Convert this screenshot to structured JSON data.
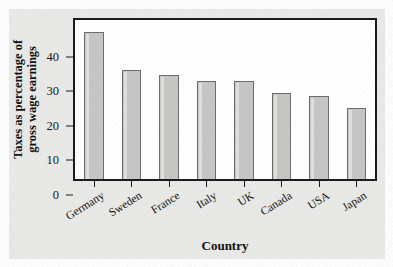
{
  "chart_data": {
    "type": "bar",
    "title": "",
    "xlabel": "Country",
    "ylabel": "Taxes as percentage of gross wage earnings",
    "ylabel_line1": "Taxes as percentage of",
    "ylabel_line2": "gross wage earnings",
    "categories": [
      "Germany",
      "Sweden",
      "France",
      "Italy",
      "UK",
      "Canada",
      "USA",
      "Japan"
    ],
    "values": [
      42.5,
      31.5,
      30.0,
      28.5,
      28.5,
      25.0,
      24.0,
      20.5
    ],
    "ylim": [
      0,
      46
    ],
    "yticks": [
      0,
      10,
      20,
      30,
      40
    ],
    "ytick_labels": [
      "0",
      "10",
      "20",
      "30",
      "40"
    ],
    "grid": false,
    "legend": false,
    "bar_color": "#c6c6c4",
    "bar_edge_color": "#6d6d6b",
    "axis_color": "#1b1b1b",
    "plot_background": "#ffffff",
    "figure_background": "#e9e9e7"
  }
}
